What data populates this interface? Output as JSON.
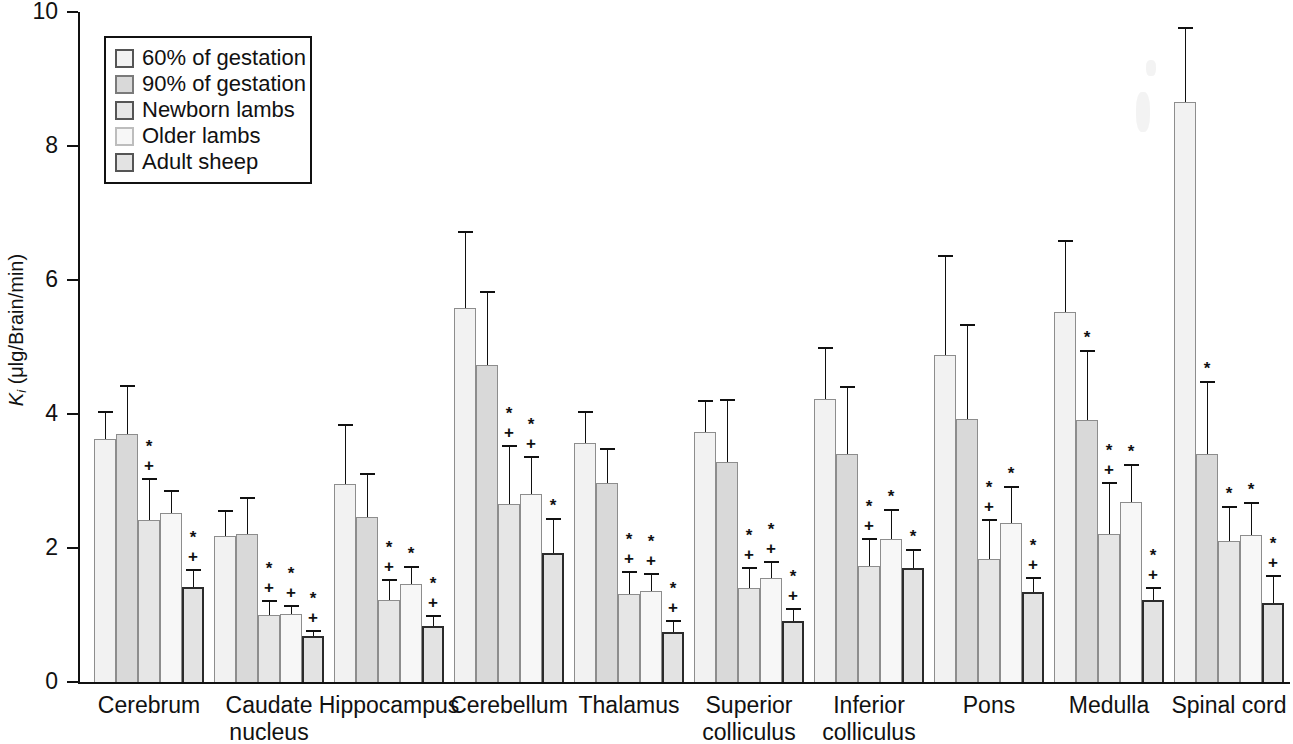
{
  "chart_data": {
    "type": "bar",
    "title": "",
    "xlabel": "",
    "ylabel": "Ki (μlg/Brain/min)",
    "ylabel_parts": {
      "symbol": "K",
      "subscript": "i",
      "units": "(μlg/Brain/min)"
    },
    "ylim": [
      0,
      10
    ],
    "yticks": [
      0,
      2,
      4,
      6,
      8,
      10
    ],
    "ytick_labels": [
      "0",
      "2",
      "4",
      "6",
      "8",
      "10"
    ],
    "grid": false,
    "legend_position": "top-left",
    "categories": [
      "Cerebrum",
      "Caudate nucleus",
      "Hippocampus",
      "Cerebellum",
      "Thalamus",
      "Superior colliculus",
      "Inferior colliculus",
      "Pons",
      "Medulla",
      "Spinal cord"
    ],
    "category_label_lines": [
      [
        "Cerebrum"
      ],
      [
        "Caudate",
        "nucleus"
      ],
      [
        "Hippocampus"
      ],
      [
        "Cerebellum"
      ],
      [
        "Thalamus"
      ],
      [
        "Superior",
        "colliculus"
      ],
      [
        "Inferior",
        "colliculus"
      ],
      [
        "Pons"
      ],
      [
        "Medulla"
      ],
      [
        "Spinal cord"
      ]
    ],
    "series": [
      {
        "name": "60% of gestation",
        "color": "#f2f2f2",
        "values": [
          3.63,
          2.18,
          2.95,
          5.58,
          3.57,
          3.73,
          4.23,
          4.88,
          5.52,
          8.65
        ],
        "errors": [
          0.42,
          0.38,
          0.9,
          1.15,
          0.47,
          0.48,
          0.77,
          1.5,
          1.08,
          1.12
        ],
        "markers": [
          "",
          "",
          "",
          "",
          "",
          "",
          "",
          "",
          "",
          ""
        ]
      },
      {
        "name": "90% of gestation",
        "color": "#d9d9d9",
        "values": [
          3.7,
          2.21,
          2.47,
          4.73,
          2.97,
          3.28,
          3.4,
          3.93,
          3.91,
          3.4
        ],
        "errors": [
          0.73,
          0.55,
          0.65,
          1.11,
          0.53,
          0.95,
          1.02,
          1.41,
          1.05,
          1.1
        ],
        "markers": [
          "",
          "",
          "",
          "",
          "",
          "",
          "",
          "",
          "*",
          "*"
        ]
      },
      {
        "name": "Newborn lambs",
        "color": "#e6e6e6",
        "values": [
          2.42,
          1.0,
          1.22,
          2.65,
          1.31,
          1.4,
          1.73,
          1.83,
          2.21,
          2.1
        ],
        "errors": [
          0.62,
          0.22,
          0.32,
          0.88,
          0.35,
          0.32,
          0.42,
          0.6,
          0.78,
          0.52
        ],
        "markers": [
          "*+",
          "*+",
          "*+",
          "*+",
          "*+",
          "*+",
          "*+",
          "*+",
          "*+",
          "*"
        ]
      },
      {
        "name": "Older lambs",
        "color": "#f7f7f7",
        "values": [
          2.52,
          1.02,
          1.46,
          2.8,
          1.36,
          1.55,
          2.14,
          2.37,
          2.68,
          2.19
        ],
        "errors": [
          0.35,
          0.13,
          0.27,
          0.58,
          0.26,
          0.25,
          0.44,
          0.55,
          0.58,
          0.5
        ],
        "markers": [
          "",
          "*+",
          "*",
          "*+",
          "*+",
          "*+",
          "*",
          "*",
          "*",
          "*"
        ]
      },
      {
        "name": "Adult sheep",
        "color": "#e3e3e3",
        "values": [
          1.42,
          0.68,
          0.83,
          1.93,
          0.74,
          0.91,
          1.7,
          1.34,
          1.22,
          1.18
        ],
        "errors": [
          0.27,
          0.1,
          0.17,
          0.52,
          0.18,
          0.2,
          0.28,
          0.22,
          0.2,
          0.42
        ],
        "markers": [
          "*+",
          "*+",
          "*+",
          "*",
          "*+",
          "*+",
          "*",
          "*+",
          "*+",
          "*+"
        ]
      }
    ],
    "significance_legend": {
      "star": "*",
      "plus": "+"
    }
  },
  "legend": {
    "items": [
      {
        "label": "60% of gestation"
      },
      {
        "label": "90% of gestation"
      },
      {
        "label": "Newborn lambs"
      },
      {
        "label": "Older lambs"
      },
      {
        "label": "Adult sheep"
      }
    ]
  }
}
